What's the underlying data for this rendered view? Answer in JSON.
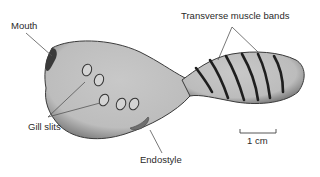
{
  "diagram": {
    "labels": {
      "mouth": "Mouth",
      "transverse_muscle_bands": "Transverse muscle bands",
      "gill_slits": "Gill slits",
      "endostyle": "Endostyle"
    },
    "scale_bar": {
      "label": "1 cm"
    },
    "colors": {
      "body_fill": "#c4c4c4",
      "body_edge": "#3a3a3a",
      "bands": "#1e1e1e",
      "endostyle": "#6f6f6f",
      "leader_lines": "#555555"
    }
  }
}
